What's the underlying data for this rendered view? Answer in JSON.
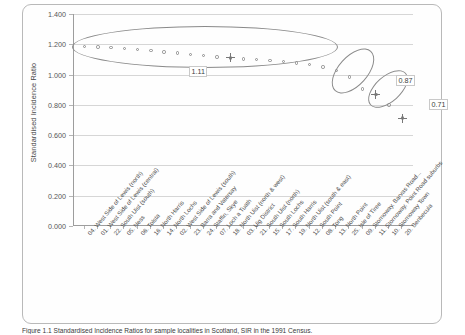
{
  "figure": {
    "caption": "Figure 1.1 Standardised Incidence Ratios for sample localities in Scotland, SIR in the 1991 Census."
  },
  "chart_data": {
    "type": "scatter",
    "title": "",
    "xlabel": "",
    "ylabel": "Standardised Incidence Ratio",
    "ylim": [
      0.0,
      1.4
    ],
    "ytick_labels": [
      "0.000",
      "0.200",
      "0.400",
      "0.600",
      "0.800",
      "1.000",
      "1.200",
      "1.400"
    ],
    "ytick_values": [
      0.0,
      0.2,
      0.4,
      0.6,
      0.8,
      1.0,
      1.2,
      1.4
    ],
    "grid": "horizontal",
    "legend": "none",
    "categories": [
      "04. West Side of Lewis (north)",
      "01. West Side of Lewis (central)",
      "22. South Uist (south)",
      "05. Ness",
      "06. Tolsta",
      "16. North Harris",
      "14. North Lochs",
      "02. West Side of Lewis (south)",
      "23. Barra and Vatersay",
      "24. Staffin, Skye",
      "07. Loch a Tuath",
      "18. North Uist (north & west)",
      "03. Uig District",
      "21. South Uist (north)",
      "15. South Lochs",
      "17. South Harris",
      "19. North Uist (south & east)",
      "12. South Point",
      "08. Tong",
      "13. North Point",
      "25. Isle of Tiree",
      "09. Stornoway, Barvas Road...",
      "11. Stornoway, Point Road suburbs",
      "10. Stornoway Town",
      "20. Benbecula"
    ],
    "values": [
      1.185,
      1.182,
      1.178,
      1.172,
      1.166,
      1.158,
      1.15,
      1.142,
      1.133,
      1.124,
      1.116,
      1.11,
      1.104,
      1.098,
      1.092,
      1.085,
      1.076,
      1.066,
      1.05,
      1.028,
      0.985,
      0.905,
      0.87,
      0.8,
      0.712
    ],
    "annotations": [
      {
        "label": "1.11",
        "value": 1.11,
        "group": "main-cluster"
      },
      {
        "label": "0.87",
        "value": 0.87,
        "group": "second-cluster"
      },
      {
        "label": "0.71",
        "value": 0.71,
        "group": "third-cluster"
      }
    ],
    "groups": [
      {
        "name": "main-cluster",
        "center": 1.11
      },
      {
        "name": "second-cluster",
        "center": 0.87
      },
      {
        "name": "third-cluster",
        "center": 0.71
      }
    ]
  }
}
